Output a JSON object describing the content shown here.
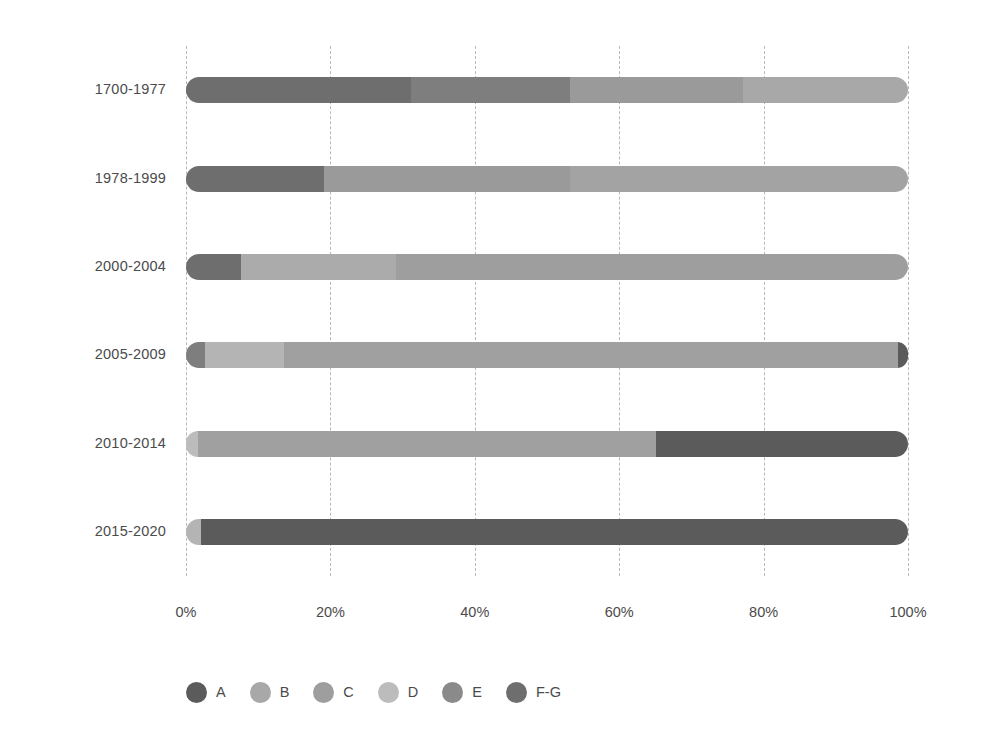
{
  "chart_data": {
    "type": "bar",
    "orientation": "horizontal",
    "stacked": true,
    "normalized_percent": true,
    "title": "",
    "subtitle": "",
    "xlabel": "",
    "ylabel": "",
    "xlim": [
      0,
      100
    ],
    "xticks": [
      0,
      20,
      40,
      60,
      80,
      100
    ],
    "xtick_labels": [
      "0%",
      "20%",
      "40%",
      "60%",
      "80%",
      "100%"
    ],
    "grid": true,
    "grid_axis": "x",
    "grid_style": "dashed",
    "grid_color": "#b8b8b8",
    "legend_position": "bottom-left",
    "categories": [
      "1700-1977",
      "1978-1999",
      "2000-2004",
      "2005-2009",
      "2010-2014",
      "2015-2020"
    ],
    "series": [
      {
        "name": "A",
        "color": "#5b5b5b",
        "values": [
          0,
          0,
          0,
          1,
          35,
          98
        ]
      },
      {
        "name": "B",
        "color": "#a8a8a8",
        "values": [
          23,
          0,
          0,
          0,
          0,
          0
        ]
      },
      {
        "name": "C",
        "color": "#9a9a9a",
        "values": [
          24,
          77,
          0,
          0,
          0,
          0
        ]
      },
      {
        "name": "D",
        "color": "#b4b4b4",
        "values": [
          0,
          4,
          82,
          89,
          63.5,
          2
        ]
      },
      {
        "name": "E",
        "color": "#7e7e7e",
        "values": [
          22,
          0,
          9,
          8,
          1.5,
          0
        ]
      },
      {
        "name": "F-G",
        "color": "#6e6e6e",
        "values": [
          31,
          19,
          9,
          2,
          0,
          0
        ]
      }
    ],
    "stacks": [
      {
        "category": "1700-1977",
        "segments": [
          {
            "name": "F-G",
            "value": 31,
            "color": "#6e6e6e"
          },
          {
            "name": "E",
            "value": 22,
            "color": "#7e7e7e"
          },
          {
            "name": "C",
            "value": 24,
            "color": "#9a9a9a"
          },
          {
            "name": "B",
            "value": 23,
            "color": "#a8a8a8"
          }
        ]
      },
      {
        "category": "1978-1999",
        "segments": [
          {
            "name": "F-G",
            "value": 19,
            "color": "#6e6e6e"
          },
          {
            "name": "C",
            "value": 34,
            "color": "#9a9a9a"
          },
          {
            "name": "B",
            "value": 47,
            "color": "#a3a3a3"
          }
        ]
      },
      {
        "category": "2000-2004",
        "segments": [
          {
            "name": "F-G",
            "value": 7.5,
            "color": "#6e6e6e"
          },
          {
            "name": "D",
            "value": 21.5,
            "color": "#ababab"
          },
          {
            "name": "C",
            "value": 71,
            "color": "#9e9e9e"
          }
        ]
      },
      {
        "category": "2005-2009",
        "segments": [
          {
            "name": "E",
            "value": 2.5,
            "color": "#7e7e7e"
          },
          {
            "name": "D",
            "value": 11,
            "color": "#b4b4b4"
          },
          {
            "name": "C",
            "value": 85,
            "color": "#a0a0a0"
          },
          {
            "name": "A",
            "value": 1.5,
            "color": "#5b5b5b"
          }
        ]
      },
      {
        "category": "2010-2014",
        "segments": [
          {
            "name": "D",
            "value": 1.5,
            "color": "#bcbcbc"
          },
          {
            "name": "C",
            "value": 63.5,
            "color": "#a0a0a0"
          },
          {
            "name": "A",
            "value": 35,
            "color": "#5b5b5b"
          }
        ]
      },
      {
        "category": "2015-2020",
        "segments": [
          {
            "name": "D",
            "value": 2,
            "color": "#b4b4b4"
          },
          {
            "name": "A",
            "value": 98,
            "color": "#5b5b5b"
          }
        ]
      }
    ],
    "legend": [
      {
        "label": "A",
        "color": "#5b5b5b"
      },
      {
        "label": "B",
        "color": "#a8a8a8"
      },
      {
        "label": "C",
        "color": "#9e9e9e"
      },
      {
        "label": "D",
        "color": "#bcbcbc"
      },
      {
        "label": "E",
        "color": "#8a8a8a"
      },
      {
        "label": "F-G",
        "color": "#6e6e6e"
      }
    ]
  }
}
